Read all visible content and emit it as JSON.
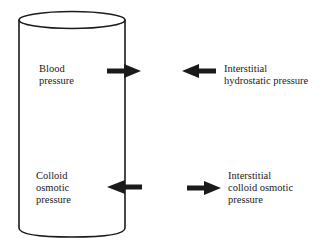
{
  "diagram": {
    "type": "capillary-pressure-diagram",
    "labels": {
      "blood_pressure": "Blood\npressure",
      "interstitial_hydrostatic": "Interstitial\nhydrostatic pressure",
      "colloid_osmotic": "Colloid\nosmotic\npressure",
      "interstitial_colloid_osmotic": "Interstitial\ncolloid osmotic\npressure"
    },
    "arrows": [
      {
        "name": "blood-pressure-arrow",
        "direction": "right"
      },
      {
        "name": "interstitial-hydrostatic-arrow",
        "direction": "left"
      },
      {
        "name": "colloid-osmotic-arrow",
        "direction": "left"
      },
      {
        "name": "interstitial-colloid-osmotic-arrow",
        "direction": "right"
      }
    ],
    "colors": {
      "stroke": "#1a1a1a",
      "background": "#ffffff"
    }
  }
}
